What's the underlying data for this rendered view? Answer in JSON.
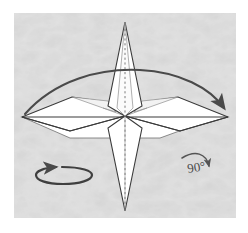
{
  "figure": {
    "background_color": "#ffffff",
    "texture_color": "#d2d2d2",
    "paper_fill": "#ffffff",
    "line_color": "#3a3a3a",
    "fold_line_color": "#8e8e8e",
    "arrow_color": "#4a4a4a",
    "texture_rect": {
      "x": 14,
      "y": 13,
      "width": 222,
      "height": 205
    }
  },
  "annotations": {
    "angle_label": {
      "text": "90°",
      "name": "rotate-90-degrees-label",
      "x": 188,
      "y": 172
    },
    "angle_arrow": {
      "name": "rotate-90-arrow",
      "description": "curved arrow bending down to the right indicating a 90 degree rotation"
    },
    "turn_around_arrow": {
      "name": "turn-around-arrow",
      "description": "flattened ellipse with arrowhead indicating turning the model around",
      "cx": 65,
      "cy": 175,
      "rx": 26,
      "ry": 8
    },
    "fold_arc_arrow": {
      "name": "fold-over-arc-arrow",
      "description": "large arc sweeping from the left wing tip over the top to the right wing tip"
    }
  },
  "model": {
    "name": "four-pointed-star",
    "center": {
      "x": 125,
      "y": 116
    },
    "points": {
      "top_tip": {
        "x": 125,
        "y": 22
      },
      "bottom_tip": {
        "x": 125,
        "y": 211
      },
      "left_tip": {
        "x": 22,
        "y": 117
      },
      "right_tip": {
        "x": 228,
        "y": 117
      }
    },
    "center_line": {
      "name": "vertical-center-crease",
      "style": "dashed"
    }
  }
}
